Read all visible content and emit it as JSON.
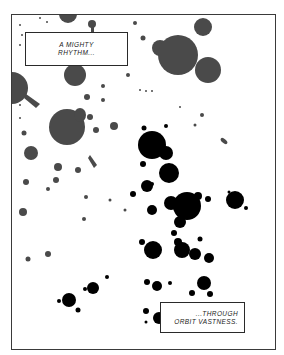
{
  "panel": {
    "description": "Comic panel of gray and black ink splatters representing stars in space",
    "colors": {
      "background": "#ffffff",
      "border": "#3a3a3a",
      "gray_splatter": "#4a4a4a",
      "black_splatter": "#000000"
    }
  },
  "captions": [
    {
      "lines": [
        "A MIGHTY",
        "RHYTHM..."
      ]
    },
    {
      "lines": [
        "...THROUGH",
        "ORBIT VASTNESS."
      ]
    }
  ]
}
